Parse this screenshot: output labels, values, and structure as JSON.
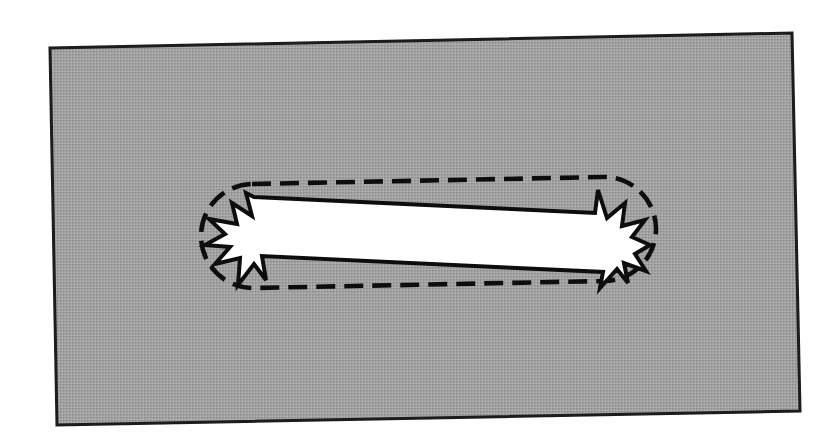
{
  "figure": {
    "kind": "scanned-technical-diagram",
    "caption": "",
    "page_background_color": "#fefefe",
    "canvas": {
      "width": 833,
      "height": 443
    }
  },
  "gray_panel": {
    "name": "gray-background-panel",
    "fill_color": "#9a9a9a",
    "halftone_light": "#b4b4b4",
    "halftone_dark": "#808080",
    "stroke_color": "#1a1a1a",
    "stroke_width": 3,
    "corners": [
      {
        "x": 50,
        "y": 48
      },
      {
        "x": 792,
        "y": 33
      },
      {
        "x": 800,
        "y": 411
      },
      {
        "x": 57,
        "y": 425
      }
    ],
    "points_attr": "50,48 792,33 800,411 57,425"
  },
  "dashed_capsule": {
    "name": "dashed-capsule-outline",
    "stroke_color": "#111111",
    "stroke_width": 4.5,
    "dash_length": 19,
    "dash_gap": 9,
    "dash_array": "19 9",
    "fill": "none",
    "bounds": {
      "x": 200,
      "y": 183,
      "width": 455,
      "height": 105
    },
    "corner_radius": 52,
    "rotation_deg": -1.1,
    "path_d": "M 252,184 L 603,177 A 52,52 0 0 1 605,281 L 254,288 A 52,52 0 0 1 252,184 Z"
  },
  "starburst": {
    "name": "white-starburst-shape",
    "fill_color": "#ffffff",
    "stroke_color": "#0d0d0d",
    "stroke_width": 4,
    "spike_count_left": 6,
    "spike_count_right": 6,
    "bounds": {
      "x": 205,
      "y": 188,
      "width": 445,
      "height": 100
    },
    "path_d": "M 246,193 L 252,216 L 232,203 L 237,224 L 209,219 L 225,234 L 205,245 L 230,247 L 215,264 L 240,258 L 238,285 L 254,264 L 266,280 L 262,256 L 603,272 L 600,288 L 617,269 L 628,283 L 624,263 L 646,271 L 635,254 L 650,245 L 632,237 L 645,220 L 622,226 L 625,203 L 607,218 L 598,190 L 595,213 L 254,197 Z"
  },
  "labels": {
    "figure_title": "",
    "annotations": []
  }
}
